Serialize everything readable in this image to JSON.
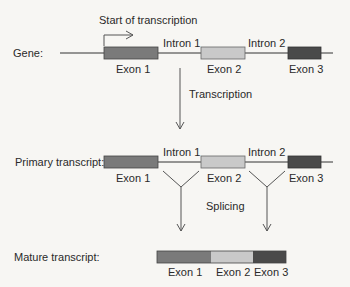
{
  "diagram": {
    "start_label": "Start of transcription",
    "gene": {
      "row_label": "Gene:",
      "intron_labels": [
        "Intron 1",
        "Intron 2"
      ],
      "exon_labels": [
        "Exon 1",
        "Exon 2",
        "Exon 3"
      ]
    },
    "transcription_label": "Transcription",
    "primary": {
      "row_label": "Primary transcript:",
      "intron_labels": [
        "Intron 1",
        "Intron 2"
      ],
      "exon_labels": [
        "Exon 1",
        "Exon 2",
        "Exon 3"
      ]
    },
    "splicing_label": "Splicing",
    "mature": {
      "row_label": "Mature transcript:",
      "exon_labels": [
        "Exon 1",
        "Exon 2",
        "Exon 3"
      ]
    },
    "colors": {
      "exon1": "#7a7a7a",
      "exon2": "#c9c9c9",
      "exon3": "#4a4a4a",
      "line": "#333333"
    }
  }
}
